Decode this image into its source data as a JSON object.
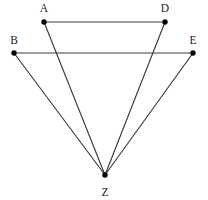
{
  "figure": {
    "kind": "geometry-diagram",
    "background_color": "#ffffff",
    "line_color": "#3a3a3a",
    "vertex_color": "#000000",
    "label_color": "#1a1a1a",
    "canvas": {
      "width": 208,
      "height": 200
    },
    "vertices": [
      {
        "id": "A",
        "label": "A",
        "x": 44,
        "y": 22,
        "label_x": 44,
        "label_y": 12
      },
      {
        "id": "D",
        "label": "D",
        "x": 165,
        "y": 22,
        "label_x": 165,
        "label_y": 12
      },
      {
        "id": "B",
        "label": "B",
        "x": 14,
        "y": 53,
        "label_x": 14,
        "label_y": 44
      },
      {
        "id": "E",
        "label": "E",
        "x": 193,
        "y": 53,
        "label_x": 193,
        "label_y": 44
      },
      {
        "id": "Z",
        "label": "Z",
        "x": 105,
        "y": 175,
        "label_x": 105,
        "label_y": 196
      }
    ],
    "edges": [
      {
        "id": "AD",
        "from": "A",
        "to": "D",
        "x1": 44,
        "y1": 22,
        "x2": 165,
        "y2": 22
      },
      {
        "id": "BE",
        "from": "B",
        "to": "E",
        "x1": 14,
        "y1": 53,
        "x2": 193,
        "y2": 53
      },
      {
        "id": "AZ",
        "from": "A",
        "to": "Z",
        "x1": 44,
        "y1": 22,
        "x2": 105,
        "y2": 175
      },
      {
        "id": "DZ",
        "from": "D",
        "to": "Z",
        "x1": 165,
        "y1": 22,
        "x2": 105,
        "y2": 175
      },
      {
        "id": "BZ",
        "from": "B",
        "to": "Z",
        "x1": 14,
        "y1": 53,
        "x2": 105,
        "y2": 175
      },
      {
        "id": "EZ",
        "from": "E",
        "to": "Z",
        "x1": 193,
        "y1": 53,
        "x2": 105,
        "y2": 175
      }
    ]
  }
}
